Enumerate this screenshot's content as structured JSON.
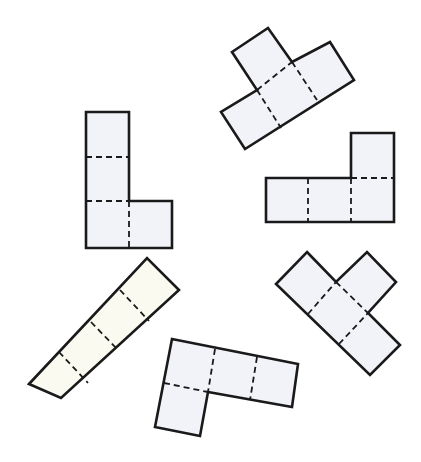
{
  "figure": {
    "colors": {
      "outline": "#1a1a1a",
      "fill_blue": "#f1f3f8",
      "fill_cream": "#fbfaf1",
      "background": "#ffffff"
    },
    "shapes": [
      {
        "id": "top-t",
        "squares": 4,
        "fill": "blue"
      },
      {
        "id": "left-l",
        "squares": 4,
        "fill": "blue"
      },
      {
        "id": "right-l",
        "squares": 4,
        "fill": "blue"
      },
      {
        "id": "strip",
        "squares": 4,
        "fill": "cream"
      },
      {
        "id": "bottom-l",
        "squares": 4,
        "fill": "blue"
      },
      {
        "id": "x-shape",
        "squares": 4,
        "fill": "blue"
      }
    ]
  }
}
